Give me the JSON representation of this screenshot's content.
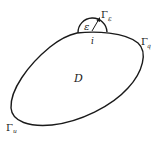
{
  "diagram": {
    "region_label": "D",
    "semicircle_radius_label": "ε",
    "singular_point_label": "i",
    "boundaries": [
      {
        "symbol": "Γ",
        "subscript": "ε",
        "name": "gamma-epsilon"
      },
      {
        "symbol": "Γ",
        "subscript": "q",
        "name": "gamma-q"
      },
      {
        "symbol": "Γ",
        "subscript": "u",
        "name": "gamma-u"
      }
    ],
    "colors": {
      "stroke": "#1a1a1a",
      "background": "#ffffff"
    }
  }
}
